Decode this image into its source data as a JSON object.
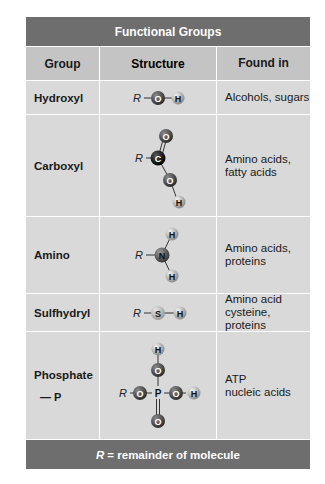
{
  "title": "Functional Groups",
  "headers": {
    "group": "Group",
    "structure": "Structure",
    "found_in": "Found in"
  },
  "rows": [
    {
      "group": "Hydroxyl",
      "structure": "R-O-H",
      "found_in": [
        "Alcohols, sugars"
      ]
    },
    {
      "group": "Carboxyl",
      "structure": "R-C(=O)-O-H",
      "found_in": [
        "Amino acids,",
        "fatty acids"
      ]
    },
    {
      "group": "Amino",
      "structure": "R-N(H)(H)",
      "found_in": [
        "Amino acids,",
        "proteins"
      ]
    },
    {
      "group": "Sulfhydryl",
      "structure": "R-S-H",
      "found_in": [
        "Amino acid",
        "cysteine, proteins"
      ]
    },
    {
      "group": "Phosphate",
      "group_symbol": "— P",
      "structure": "R-O-P(=O)(O-H)-O-H",
      "found_in": [
        "ATP",
        "nucleic acids"
      ]
    }
  ],
  "footer": {
    "r_symbol": "R",
    "text": "= remainder of molecule"
  },
  "atom_labels": {
    "R": "R",
    "O": "O",
    "H": "H",
    "C": "C",
    "N": "N",
    "S": "S",
    "P": "P"
  },
  "colors": {
    "title_bar": "#6e6e6e",
    "header_row": "#c4c4c4",
    "body_row": "#d9d9d9",
    "oxygen": "#4a4a4a",
    "hydrogen": "#b5b5b5",
    "carbon": "#111111",
    "nitrogen": "#5a5a5a",
    "sulfur": "#bdbdbd"
  }
}
